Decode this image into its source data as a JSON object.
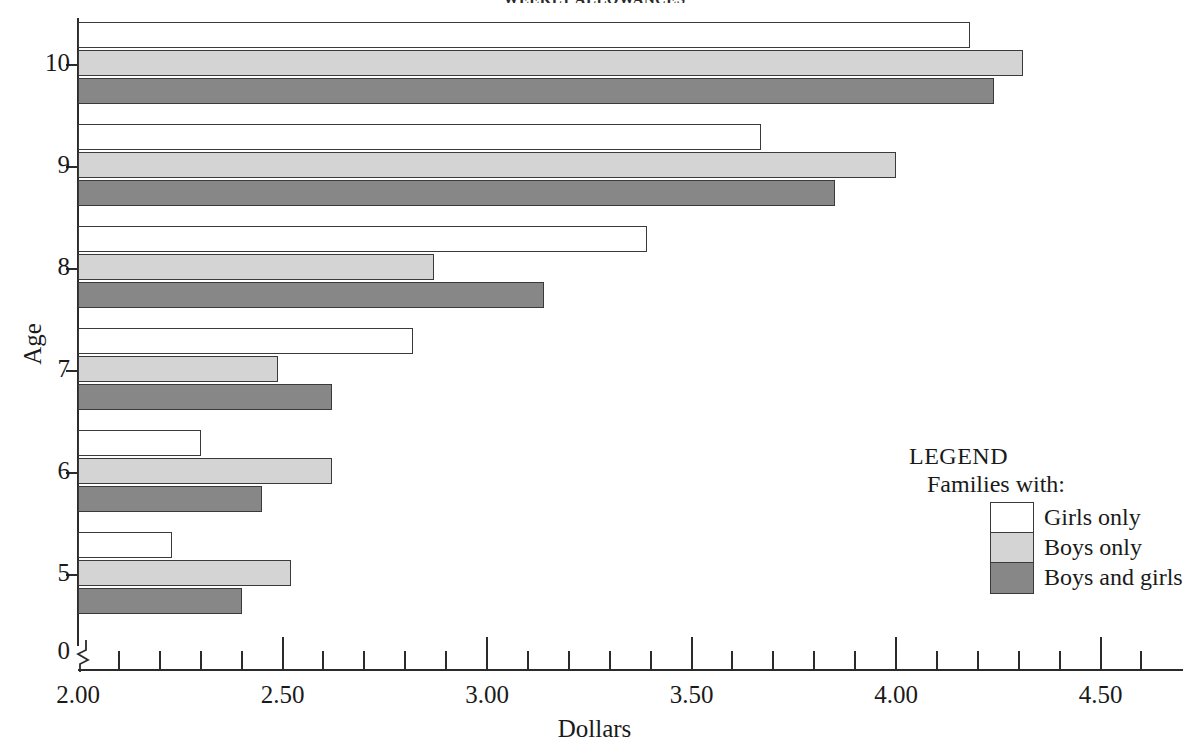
{
  "chart_data": {
    "type": "bar",
    "orientation": "horizontal",
    "title": "WEEKLY ALLOWANCES",
    "xlabel": "Dollars",
    "ylabel": "Age",
    "categories": [
      "5",
      "6",
      "7",
      "8",
      "9",
      "10"
    ],
    "series": [
      {
        "name": "Girls only",
        "color": "#ffffff",
        "values": [
          2.23,
          2.3,
          2.82,
          3.39,
          3.67,
          4.18
        ]
      },
      {
        "name": "Boys only",
        "color": "#d4d4d4",
        "values": [
          2.52,
          2.62,
          2.49,
          2.87,
          4.0,
          4.31
        ]
      },
      {
        "name": "Boys and girls",
        "color": "#878787",
        "values": [
          2.4,
          2.45,
          2.62,
          3.14,
          3.85,
          4.24
        ]
      }
    ],
    "xlim": [
      2.0,
      4.6
    ],
    "x_major_ticks": [
      "2.00",
      "2.50",
      "3.00",
      "3.50",
      "4.00",
      "4.50"
    ],
    "x_minor_tick_step": 0.1,
    "y_ticks": [
      "0",
      "5",
      "6",
      "7",
      "8",
      "9",
      "10"
    ],
    "axis_break": true,
    "grid": false,
    "legend_position": "inside-right"
  },
  "legend": {
    "title": "LEGEND",
    "subtitle": "Families with:",
    "entries": [
      {
        "label": "Girls only"
      },
      {
        "label": "Boys only"
      },
      {
        "label": "Boys and girls"
      }
    ]
  }
}
